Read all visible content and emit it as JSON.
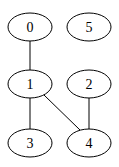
{
  "graph": {
    "type": "undirected",
    "nodes": [
      {
        "id": "0",
        "label": "0",
        "cx": 30,
        "cy": 27
      },
      {
        "id": "5",
        "label": "5",
        "cx": 89,
        "cy": 27
      },
      {
        "id": "1",
        "label": "1",
        "cx": 30,
        "cy": 84
      },
      {
        "id": "2",
        "label": "2",
        "cx": 89,
        "cy": 84
      },
      {
        "id": "3",
        "label": "3",
        "cx": 30,
        "cy": 143
      },
      {
        "id": "4",
        "label": "4",
        "cx": 89,
        "cy": 143
      }
    ],
    "edges": [
      {
        "from": "0",
        "to": "1"
      },
      {
        "from": "1",
        "to": "3"
      },
      {
        "from": "1",
        "to": "4"
      },
      {
        "from": "2",
        "to": "4"
      }
    ]
  }
}
